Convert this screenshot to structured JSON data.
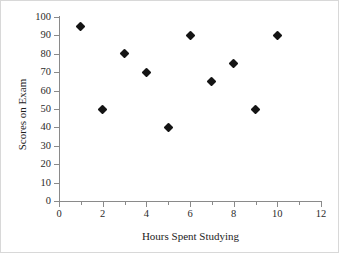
{
  "chart_data": {
    "type": "scatter",
    "title": "",
    "xlabel": "Hours Spent Studying",
    "ylabel": "Scores on Exam",
    "xlim": [
      0,
      12
    ],
    "ylim": [
      0,
      100
    ],
    "grid": false,
    "legend": null,
    "x_ticks": [
      0,
      2,
      4,
      6,
      8,
      10,
      12
    ],
    "x_minor_ticks": [
      1,
      3,
      5,
      7,
      9,
      11
    ],
    "y_ticks": [
      0,
      10,
      20,
      30,
      40,
      50,
      60,
      70,
      80,
      90,
      100
    ],
    "x_tick_labels": [
      "0",
      "2",
      "4",
      "6",
      "8",
      "10",
      "12"
    ],
    "y_tick_labels": [
      "0",
      "10",
      "20",
      "30",
      "40",
      "50",
      "60",
      "70",
      "80",
      "90",
      "100"
    ],
    "marker": "diamond",
    "marker_color": "#141414",
    "axis_color": "#8a8a8a",
    "x": [
      1,
      2,
      3,
      4,
      5,
      6,
      7,
      8,
      9,
      10
    ],
    "y": [
      95,
      50,
      80,
      70,
      40,
      90,
      65,
      75,
      50,
      90
    ],
    "points": [
      {
        "x": 1,
        "y": 95
      },
      {
        "x": 2,
        "y": 50
      },
      {
        "x": 3,
        "y": 80
      },
      {
        "x": 4,
        "y": 70
      },
      {
        "x": 5,
        "y": 40
      },
      {
        "x": 6,
        "y": 90
      },
      {
        "x": 7,
        "y": 65
      },
      {
        "x": 8,
        "y": 75
      },
      {
        "x": 9,
        "y": 50
      },
      {
        "x": 10,
        "y": 90
      }
    ]
  }
}
